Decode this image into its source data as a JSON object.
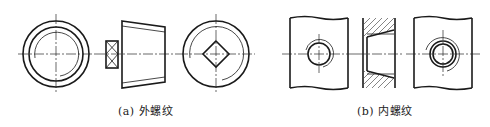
{
  "figure": {
    "panels": [
      {
        "id": "a",
        "caption": "(a)  外螺纹",
        "views": [
          "end-view-circle",
          "side-view-tapered-thread",
          "end-view-square-head"
        ]
      },
      {
        "id": "b",
        "caption": "(b)  内螺纹",
        "views": [
          "plate-with-threaded-hole",
          "section-view-hatched",
          "plate-with-threaded-hole-chamfer"
        ]
      }
    ]
  }
}
